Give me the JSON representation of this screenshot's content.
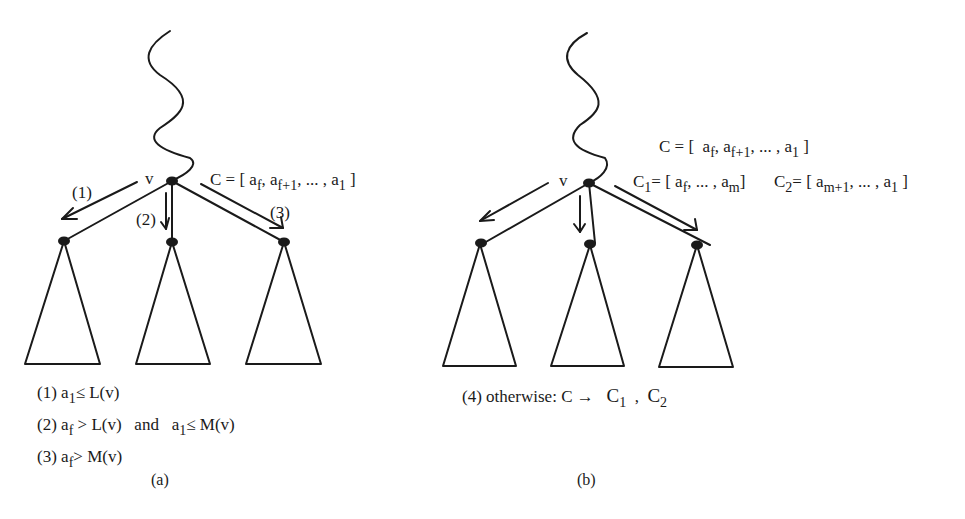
{
  "figure": {
    "panels": [
      {
        "id": "a",
        "caption": "(a)",
        "node_label": "v",
        "list_label": {
          "prefix": "C = [ a",
          "parts": [
            {
              "text": "a",
              "sub": "f"
            },
            {
              "text": ", a",
              "sub": "f+1"
            },
            {
              "text": ", ... , a",
              "sub": "1"
            },
            {
              "text": " ]",
              "sub": ""
            }
          ]
        },
        "arrow_labels": [
          "(1)",
          "(2)",
          "(3)"
        ],
        "conditions": [
          {
            "num": "(1)",
            "text_a": "a",
            "sub_a": "1",
            "rel_a": "≤ L(v)",
            "and": "",
            "text_b": "",
            "sub_b": "",
            "rel_b": ""
          },
          {
            "num": "(2)",
            "text_a": "a",
            "sub_a": "f",
            "rel_a": "> L(v)",
            "and": "and",
            "text_b": "a",
            "sub_b": "1",
            "rel_b": "≤ M(v)"
          },
          {
            "num": "(3)",
            "text_a": "a",
            "sub_a": "f",
            "rel_a": "> M(v)",
            "and": "",
            "text_b": "",
            "sub_b": "",
            "rel_b": ""
          }
        ]
      },
      {
        "id": "b",
        "caption": "(b)",
        "node_label": "v",
        "list_label_c": {
          "head": "C = [  a",
          "parts": [
            {
              "text": "a",
              "sub": "f"
            },
            {
              "text": ", a",
              "sub": "f+1"
            },
            {
              "text": ", ... , a",
              "sub": "1"
            },
            {
              "text": " ]",
              "sub": ""
            }
          ]
        },
        "list_label_c1": {
          "name": "C",
          "name_sub": "1",
          "parts": [
            {
              "text": "= [ a",
              "sub": "f"
            },
            {
              "text": ", ... , a",
              "sub": "m"
            },
            {
              "text": "]",
              "sub": ""
            }
          ]
        },
        "list_label_c2": {
          "name": "C",
          "name_sub": "2",
          "parts": [
            {
              "text": "= [ a",
              "sub": "m+1"
            },
            {
              "text": ", ... , a",
              "sub": "1"
            },
            {
              "text": " ]",
              "sub": ""
            }
          ]
        },
        "condition": {
          "num": "(4)",
          "text": "otherwise: C →",
          "c1": "C",
          "c1_sub": "1",
          "sep": ",",
          "c2": "C",
          "c2_sub": "2"
        }
      }
    ],
    "colors": {
      "ink": "#1a1a1a",
      "background": "#ffffff"
    }
  }
}
